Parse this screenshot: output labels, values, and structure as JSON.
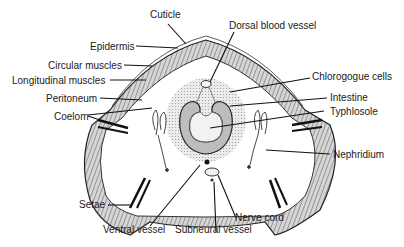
{
  "diagram": {
    "labels": {
      "cuticle": "Cuticle",
      "epidermis": "Epidermis",
      "circular_muscles": "Circular muscles",
      "longitudinal_muscles": "Longitudinal muscles",
      "peritoneum": "Peritoneum",
      "coelom": "Coelom",
      "setae": "Setae",
      "ventral_vessel": "Ventral vessel",
      "subneural_vessel": "Subneural vessel",
      "nerve_cord": "Nerve cord",
      "nephridium": "Nephridium",
      "typhlosole": "Typhlosole",
      "intestine": "Intestine",
      "chlorogogue_cells": "Chlorogogue cells",
      "dorsal_blood_vessel": "Dorsal blood vessel"
    },
    "colors": {
      "ink": "#1a1a1a",
      "muscle_fill": "#c9c9c9",
      "chlorogogue_fill": "#e4e4e4",
      "background": "#ffffff"
    }
  }
}
